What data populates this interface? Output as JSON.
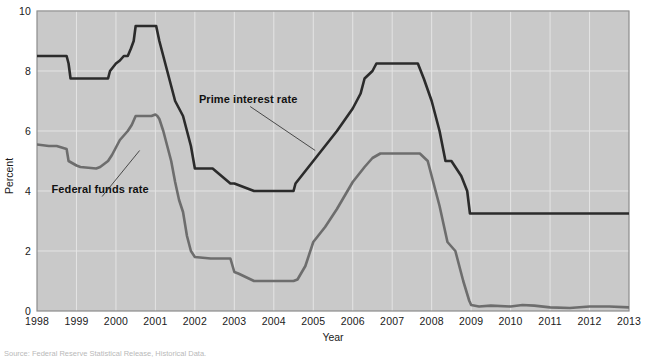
{
  "figure": {
    "source_note": "Source: Federal Reserve Statistical Release, Historical Data.",
    "background": "#ffffff",
    "plot_background": "#c9c9c9",
    "grid_color": "#e4e4e4",
    "border_color": "#8d8d8d"
  },
  "chart_data": {
    "type": "line",
    "title": "",
    "xlabel": "Year",
    "ylabel": "Percent",
    "xlim": [
      1998,
      2013
    ],
    "ylim": [
      0,
      10
    ],
    "xticks": [
      "1998",
      "1999",
      "2000",
      "2001",
      "2002",
      "2003",
      "2004",
      "2005",
      "2006",
      "2007",
      "2008",
      "2009",
      "2010",
      "2011",
      "2012",
      "2013"
    ],
    "yticks": [
      "0",
      "2",
      "4",
      "6",
      "8",
      "10"
    ],
    "grid": true,
    "legend_position": "inline-annotation",
    "series": [
      {
        "name": "Prime interest rate",
        "color": "#2b2b2b",
        "label_x": 2003.35,
        "label_y": 6.95,
        "leader_to_x": 2005.05,
        "leader_to_y": 5.35,
        "x": [
          1998.0,
          1998.75,
          1998.8,
          1998.85,
          1999.0,
          1999.5,
          1999.55,
          1999.6,
          1999.8,
          1999.85,
          2000.0,
          2000.1,
          2000.2,
          2000.3,
          2000.38,
          2000.45,
          2000.5,
          2001.0,
          2001.02,
          2001.1,
          2001.2,
          2001.3,
          2001.4,
          2001.5,
          2001.6,
          2001.7,
          2001.8,
          2001.9,
          2002.0,
          2002.4,
          2002.45,
          2002.9,
          2002.95,
          2003.0,
          2003.5,
          2003.55,
          2004.0,
          2004.5,
          2004.55,
          2004.7,
          2005.0,
          2005.3,
          2005.6,
          2006.0,
          2006.2,
          2006.3,
          2006.5,
          2006.6,
          2007.0,
          2007.5,
          2007.65,
          2007.8,
          2008.0,
          2008.2,
          2008.35,
          2008.5,
          2008.75,
          2008.9,
          2008.97,
          2009.0,
          2009.2,
          2010.0,
          2011.0,
          2012.0,
          2013.0
        ],
        "y": [
          8.5,
          8.5,
          8.25,
          7.75,
          7.75,
          7.75,
          7.75,
          7.75,
          7.75,
          8.0,
          8.25,
          8.35,
          8.5,
          8.5,
          8.75,
          9.0,
          9.5,
          9.5,
          9.5,
          9.0,
          8.5,
          8.0,
          7.5,
          7.0,
          6.75,
          6.5,
          6.0,
          5.5,
          4.75,
          4.75,
          4.75,
          4.25,
          4.25,
          4.25,
          4.0,
          4.0,
          4.0,
          4.0,
          4.25,
          4.5,
          5.0,
          5.5,
          6.0,
          6.75,
          7.25,
          7.75,
          8.0,
          8.25,
          8.25,
          8.25,
          8.25,
          7.75,
          7.0,
          6.0,
          5.0,
          5.0,
          4.5,
          4.0,
          3.25,
          3.25,
          3.25,
          3.25,
          3.25,
          3.25,
          3.25
        ]
      },
      {
        "name": "Federal funds rate",
        "color": "#6d6d6d",
        "label_x": 1999.6,
        "label_y": 3.95,
        "leader_to_x": 2000.6,
        "leader_to_y": 5.35,
        "x": [
          1998.0,
          1998.3,
          1998.5,
          1998.75,
          1998.8,
          1999.0,
          1999.1,
          1999.5,
          1999.6,
          1999.8,
          1999.9,
          2000.0,
          2000.1,
          2000.2,
          2000.3,
          2000.4,
          2000.5,
          2000.9,
          2001.0,
          2001.05,
          2001.1,
          2001.2,
          2001.3,
          2001.4,
          2001.5,
          2001.6,
          2001.7,
          2001.8,
          2001.9,
          2002.0,
          2002.4,
          2002.5,
          2002.9,
          2003.0,
          2003.1,
          2003.5,
          2003.6,
          2004.0,
          2004.5,
          2004.6,
          2004.8,
          2005.0,
          2005.3,
          2005.6,
          2006.0,
          2006.3,
          2006.5,
          2006.7,
          2007.0,
          2007.5,
          2007.7,
          2007.9,
          2008.0,
          2008.2,
          2008.4,
          2008.6,
          2008.8,
          2008.95,
          2009.0,
          2009.2,
          2009.5,
          2010.0,
          2010.3,
          2010.6,
          2011.0,
          2011.5,
          2012.0,
          2012.5,
          2013.0
        ],
        "y": [
          5.55,
          5.5,
          5.5,
          5.4,
          5.0,
          4.85,
          4.8,
          4.75,
          4.8,
          5.0,
          5.2,
          5.45,
          5.7,
          5.85,
          6.0,
          6.2,
          6.5,
          6.5,
          6.55,
          6.5,
          6.4,
          6.0,
          5.5,
          5.0,
          4.3,
          3.7,
          3.3,
          2.5,
          2.0,
          1.8,
          1.75,
          1.75,
          1.75,
          1.3,
          1.25,
          1.0,
          1.0,
          1.0,
          1.0,
          1.05,
          1.5,
          2.3,
          2.8,
          3.4,
          4.3,
          4.8,
          5.1,
          5.25,
          5.25,
          5.25,
          5.25,
          5.0,
          4.5,
          3.5,
          2.3,
          2.0,
          1.0,
          0.35,
          0.2,
          0.15,
          0.18,
          0.15,
          0.2,
          0.18,
          0.12,
          0.1,
          0.15,
          0.15,
          0.12
        ]
      }
    ]
  }
}
